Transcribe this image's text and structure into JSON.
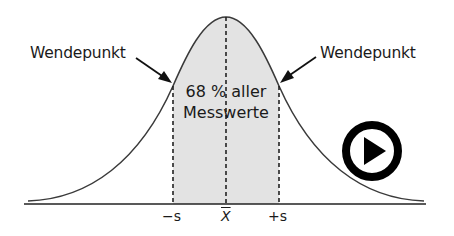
{
  "diagram": {
    "labels": {
      "inflection_left": "Wendepunkt",
      "inflection_right": "Wendepunkt",
      "center_line1": "68 % aller",
      "center_line2": "Messwerte"
    },
    "axis_ticks": {
      "minus_s": "−s",
      "mean": "X",
      "plus_s": "+s"
    },
    "colors": {
      "curve": "#3a3a3a",
      "shaded_area": "#e2e2e2",
      "axis": "#222222",
      "text": "#1a1a1a",
      "play_icon": "#000000"
    },
    "icons": {
      "play": "play-icon"
    }
  }
}
